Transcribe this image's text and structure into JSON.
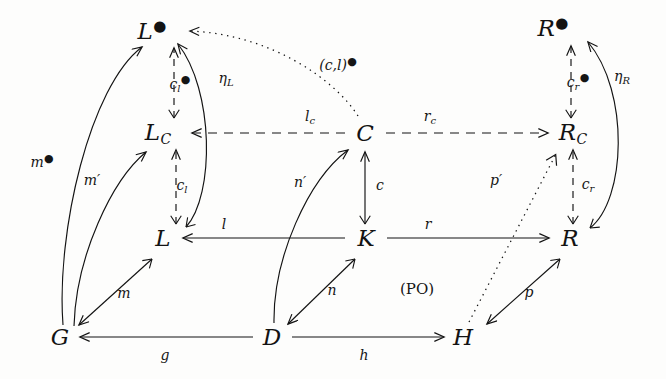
{
  "figure": {
    "type": "commutative-diagram",
    "caption_note": "(PO)",
    "background": "#fdfdfc",
    "ink": "#131313"
  },
  "nodes": [
    {
      "id": "Ldot",
      "base": "L",
      "sub": "",
      "dot": true,
      "x": 152,
      "y": 31
    },
    {
      "id": "Rdot",
      "base": "R",
      "sub": "",
      "dot": true,
      "x": 553,
      "y": 28
    },
    {
      "id": "LC",
      "base": "L",
      "sub": "C",
      "dot": false,
      "x": 158,
      "y": 133
    },
    {
      "id": "C",
      "base": "C",
      "sub": "",
      "dot": false,
      "x": 365,
      "y": 133
    },
    {
      "id": "RC",
      "base": "R",
      "sub": "C",
      "dot": false,
      "x": 573,
      "y": 133
    },
    {
      "id": "L",
      "base": "L",
      "sub": "",
      "dot": false,
      "x": 163,
      "y": 238
    },
    {
      "id": "K",
      "base": "K",
      "sub": "",
      "dot": false,
      "x": 366,
      "y": 238
    },
    {
      "id": "R",
      "base": "R",
      "sub": "",
      "dot": false,
      "x": 570,
      "y": 238
    },
    {
      "id": "G",
      "base": "G",
      "sub": "",
      "dot": false,
      "x": 60,
      "y": 337
    },
    {
      "id": "D",
      "base": "D",
      "sub": "",
      "dot": false,
      "x": 272,
      "y": 337
    },
    {
      "id": "H",
      "base": "H",
      "sub": "",
      "dot": false,
      "x": 463,
      "y": 337
    }
  ],
  "edge_labels": [
    {
      "id": "cl_dot",
      "base": "c",
      "sub": "l",
      "dot": true,
      "x": 180,
      "y": 84
    },
    {
      "id": "eta_L",
      "base": "η",
      "sub": "L",
      "dot": false,
      "x": 226,
      "y": 79
    },
    {
      "id": "cl_pair",
      "base": "(c,l)",
      "sub": "",
      "dot": true,
      "x": 338,
      "y": 64
    },
    {
      "id": "cr_dot",
      "base": "c",
      "sub": "r",
      "dot": true,
      "x": 578,
      "y": 82
    },
    {
      "id": "eta_R",
      "base": "η",
      "sub": "R",
      "dot": false,
      "x": 622,
      "y": 77
    },
    {
      "id": "l_c",
      "base": "l",
      "sub": "c",
      "dot": false,
      "x": 310,
      "y": 117
    },
    {
      "id": "r_c",
      "base": "r",
      "sub": "c",
      "dot": false,
      "x": 430,
      "y": 117
    },
    {
      "id": "m_dot",
      "base": "m",
      "sub": "",
      "dot": true,
      "x": 42,
      "y": 161
    },
    {
      "id": "m_prime",
      "base": "m",
      "sub": "",
      "prime": true,
      "dot": false,
      "x": 92,
      "y": 180
    },
    {
      "id": "cl_low",
      "base": "c",
      "sub": "l",
      "dot": false,
      "x": 182,
      "y": 186
    },
    {
      "id": "n_prime",
      "base": "n",
      "sub": "",
      "prime": true,
      "dot": false,
      "x": 300,
      "y": 182
    },
    {
      "id": "c",
      "base": "c",
      "sub": "",
      "dot": false,
      "x": 380,
      "y": 185
    },
    {
      "id": "p_prime",
      "base": "p",
      "sub": "",
      "prime": true,
      "dot": false,
      "x": 496,
      "y": 180
    },
    {
      "id": "cr_low",
      "base": "c",
      "sub": "r",
      "dot": false,
      "x": 588,
      "y": 185
    },
    {
      "id": "l",
      "base": "l",
      "sub": "",
      "dot": false,
      "x": 224,
      "y": 224
    },
    {
      "id": "r",
      "base": "r",
      "sub": "",
      "dot": false,
      "x": 428,
      "y": 224
    },
    {
      "id": "m",
      "base": "m",
      "sub": "",
      "dot": false,
      "x": 124,
      "y": 293
    },
    {
      "id": "n",
      "base": "n",
      "sub": "",
      "dot": false,
      "x": 332,
      "y": 290
    },
    {
      "id": "p",
      "base": "p",
      "sub": "",
      "dot": false,
      "x": 529,
      "y": 292
    },
    {
      "id": "PO",
      "base": "(PO)",
      "sub": "",
      "dot": false,
      "upright": true,
      "x": 417,
      "y": 289
    },
    {
      "id": "g",
      "base": "g",
      "sub": "",
      "dot": false,
      "x": 165,
      "y": 355
    },
    {
      "id": "h",
      "base": "h",
      "sub": "",
      "dot": false,
      "x": 364,
      "y": 355
    }
  ],
  "edges": [
    {
      "id": "LC-to-Ldot",
      "label": "cl_dot",
      "style": "dashed-mono",
      "from": "LC",
      "to": "Ldot"
    },
    {
      "id": "L-to-LC",
      "label": "cl_low",
      "style": "dashed-mono",
      "from": "L",
      "to": "LC"
    },
    {
      "id": "RC-to-Rdot",
      "label": "cr_dot",
      "style": "dashed-mono",
      "from": "RC",
      "to": "Rdot"
    },
    {
      "id": "R-to-RC",
      "label": "cr_low",
      "style": "dashed-mono",
      "from": "R",
      "to": "RC"
    },
    {
      "id": "C-to-LC",
      "label": "l_c",
      "style": "dashed",
      "from": "C",
      "to": "LC"
    },
    {
      "id": "C-to-RC",
      "label": "r_c",
      "style": "dashed",
      "from": "C",
      "to": "RC"
    },
    {
      "id": "C-to-Ldot",
      "label": "cl_pair",
      "style": "dotted",
      "from": "C",
      "to": "Ldot"
    },
    {
      "id": "H-to-RC",
      "label": "p_prime",
      "style": "dotted-mono",
      "from": "H",
      "to": "RC"
    },
    {
      "id": "L-to-Ldot",
      "label": "eta_L",
      "style": "curve",
      "from": "L",
      "to": "Ldot"
    },
    {
      "id": "R-to-Rdot",
      "label": "eta_R",
      "style": "curve",
      "from": "R",
      "to": "Rdot"
    },
    {
      "id": "G-to-Ldot",
      "label": "m_dot",
      "style": "curve",
      "from": "G",
      "to": "Ldot"
    },
    {
      "id": "G-to-LC",
      "label": "m_prime",
      "style": "curve",
      "from": "G",
      "to": "LC"
    },
    {
      "id": "D-to-C",
      "label": "n_prime",
      "style": "curve",
      "from": "D",
      "to": "C"
    },
    {
      "id": "K-to-C",
      "label": "c",
      "style": "solid-mono",
      "from": "K",
      "to": "C"
    },
    {
      "id": "K-to-L",
      "label": "l",
      "style": "solid",
      "from": "K",
      "to": "L"
    },
    {
      "id": "K-to-R",
      "label": "r",
      "style": "solid",
      "from": "K",
      "to": "R"
    },
    {
      "id": "L-to-G",
      "label": "m",
      "style": "solid-mono",
      "from": "L",
      "to": "G"
    },
    {
      "id": "K-to-D",
      "label": "n",
      "style": "solid-mono",
      "from": "K",
      "to": "D"
    },
    {
      "id": "R-to-H",
      "label": "p",
      "style": "solid-mono",
      "from": "R",
      "to": "H"
    },
    {
      "id": "D-to-G",
      "label": "g",
      "style": "solid",
      "from": "D",
      "to": "G"
    },
    {
      "id": "D-to-H",
      "label": "h",
      "style": "solid",
      "from": "D",
      "to": "H"
    }
  ]
}
